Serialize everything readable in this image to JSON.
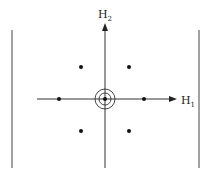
{
  "diagram": {
    "type": "weight-diagram",
    "axes": {
      "horizontal": {
        "label": "H",
        "subscript": "1"
      },
      "vertical": {
        "label": "H",
        "subscript": "2"
      }
    },
    "center": {
      "x": 105,
      "y": 99,
      "rings": 2
    },
    "points": [
      {
        "x": 81,
        "y": 67
      },
      {
        "x": 129,
        "y": 67
      },
      {
        "x": 59,
        "y": 99
      },
      {
        "x": 144,
        "y": 99
      },
      {
        "x": 81,
        "y": 131
      },
      {
        "x": 129,
        "y": 131
      }
    ],
    "colors": {
      "stroke": "#333333",
      "point": "#111111"
    }
  }
}
